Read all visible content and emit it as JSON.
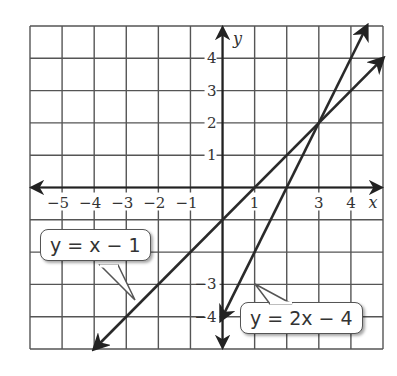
{
  "chart_data": {
    "type": "line",
    "title": "",
    "xlabel": "x",
    "ylabel": "y",
    "xlim": [
      -6,
      5
    ],
    "ylim": [
      -5,
      5
    ],
    "grid": true,
    "x_tick_labels": [
      "-5",
      "-4",
      "-3",
      "-2",
      "-1",
      "1",
      "3",
      "4"
    ],
    "y_tick_labels": [
      "4",
      "3",
      "2",
      "1",
      "-3",
      "-4"
    ],
    "series": [
      {
        "name": "y = x - 1",
        "slope": 1,
        "intercept": -1,
        "x": [
          -4,
          5
        ],
        "y": [
          -5,
          4
        ]
      },
      {
        "name": "y = 2x - 4",
        "slope": 2,
        "intercept": -4,
        "x": [
          -0.05,
          4.5
        ],
        "y": [
          -4.1,
          5
        ]
      }
    ],
    "intersection": {
      "x": 3,
      "y": 2
    },
    "annotations": [
      {
        "text": "y = x − 1",
        "points_to": "line y = x - 1"
      },
      {
        "text": "y = 2x − 4",
        "points_to": "line y = 2x - 4"
      }
    ]
  },
  "labels": {
    "x_axis": "x",
    "y_axis": "y",
    "callout1": "y = x − 1",
    "callout2": "y = 2x − 4"
  }
}
